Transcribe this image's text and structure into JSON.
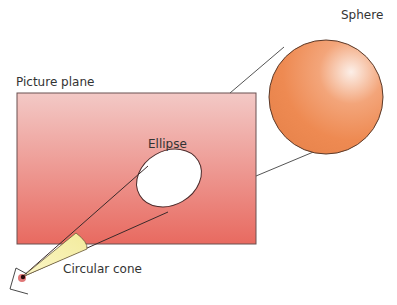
{
  "diagram": {
    "labels": {
      "picture_plane": "Picture plane",
      "sphere": "Sphere",
      "ellipse": "Ellipse",
      "cone": "Circular cone"
    },
    "colors": {
      "plane_top": "#f3c6c3",
      "plane_bottom": "#e8665e",
      "sphere_base": "#ee8a55",
      "sphere_highlight": "#fbeee6",
      "cone_fill": "#f7f2b8",
      "line": "#555555"
    }
  }
}
